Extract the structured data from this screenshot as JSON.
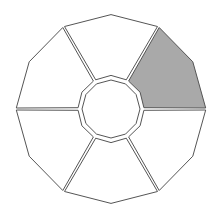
{
  "diagram": {
    "type": "dodecagon-ring-sectors",
    "center": [
      111,
      109
    ],
    "outer_radius": 96,
    "inner_radius": 29,
    "sector_count": 6,
    "outer_sides": 12,
    "inner_sides": 12,
    "stroke_color": "#555555",
    "fill_color": "#ffffff",
    "shaded_color": "#a9a9a9",
    "shaded_sector_index": 1,
    "sectors": [
      {
        "name": "top",
        "shaded": false
      },
      {
        "name": "upper-right",
        "shaded": true
      },
      {
        "name": "lower-right",
        "shaded": false
      },
      {
        "name": "bottom",
        "shaded": false
      },
      {
        "name": "lower-left",
        "shaded": false
      },
      {
        "name": "upper-left",
        "shaded": false
      }
    ]
  }
}
